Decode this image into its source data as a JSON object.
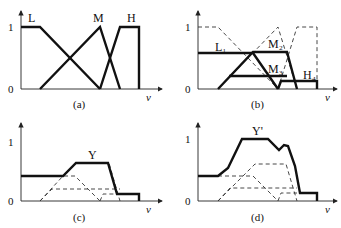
{
  "figure": {
    "axis_var": "v",
    "tick_one": "1",
    "tick_zero": "0",
    "panels": [
      {
        "id": "a",
        "caption": "(a)",
        "labels": {
          "L": "L",
          "M": "M",
          "H": "H"
        }
      },
      {
        "id": "b",
        "caption": "(b)",
        "labels": {
          "L1": "L₁",
          "M2": "M₂",
          "M3": "M₃",
          "H4": "H₄"
        }
      },
      {
        "id": "c",
        "caption": "(c)",
        "labels": {
          "Y": "Y"
        }
      },
      {
        "id": "d",
        "caption": "(d)",
        "labels": {
          "Y": "Y'"
        }
      }
    ]
  },
  "colors": {
    "line": "#111111",
    "background": "#ffffff"
  }
}
